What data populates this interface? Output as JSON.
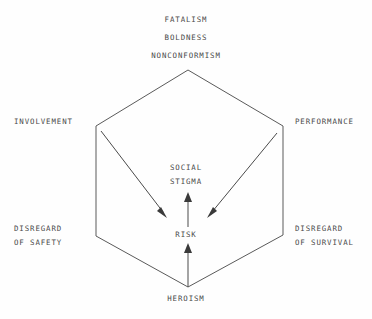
{
  "diagram": {
    "type": "hexagon-concept-diagram",
    "top_attributes": [
      {
        "label": "FATALISM"
      },
      {
        "label": "BOLDNESS"
      },
      {
        "label": "NONCONFORMISM"
      }
    ],
    "vertex_labels": {
      "upper_left": "INVOLVEMENT",
      "upper_right": "PERFORMANCE",
      "lower_left": "DISREGARD\nOF SAFETY",
      "lower_right": "DISREGARD\nOF SURVIVAL",
      "bottom": "HEROISM"
    },
    "center_labels": {
      "upper": "SOCIAL\nSTIGMA",
      "lower": "RISK"
    },
    "arrows": [
      {
        "from": "INVOLVEMENT",
        "to": "RISK",
        "direction": "down-right"
      },
      {
        "from": "PERFORMANCE",
        "to": "RISK",
        "direction": "down-left"
      },
      {
        "from": "HEROISM",
        "to": "RISK",
        "direction": "up"
      },
      {
        "from": "RISK",
        "to": "SOCIAL STIGMA",
        "direction": "up"
      }
    ],
    "colors": {
      "background": "#fefefe",
      "stroke": "#5a5a5a",
      "text": "#4a4a4a",
      "arrowhead": "#3a3a3a"
    }
  }
}
